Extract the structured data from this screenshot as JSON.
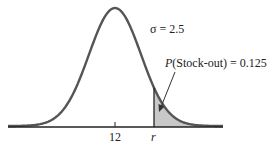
{
  "chart_data": {
    "type": "area",
    "title": "",
    "distribution": "normal",
    "mean": 12,
    "sigma": 2.5,
    "sigma_label": "σ = 2.5",
    "x_ticks": [
      "12",
      "r"
    ],
    "shaded_region": "x > r",
    "annotation": {
      "prefix": "P",
      "text": "(Stock-out) = 0.125",
      "value": 0.125
    },
    "xlabel": "",
    "ylabel": "",
    "grid": false,
    "legend": "none",
    "colors": {
      "curve": "#555555",
      "shade": "#c8c8c8",
      "axis": "#222222"
    }
  },
  "labels": {
    "sigma": "σ = 2.5",
    "prob_prefix": "P",
    "prob_text": "(Stock-out) = 0.125",
    "tick_mean": "12",
    "tick_r": "r"
  }
}
